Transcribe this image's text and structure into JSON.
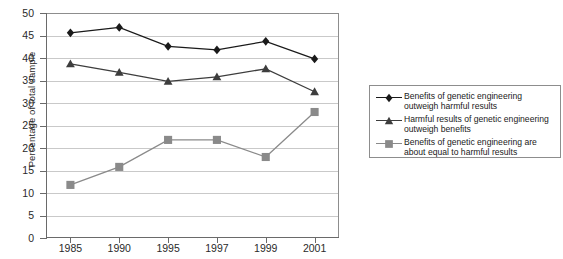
{
  "chart_data": {
    "type": "line",
    "title": "",
    "xlabel": "",
    "ylabel": "Percentage of total sample",
    "categories": [
      "1985",
      "1990",
      "1995",
      "1997",
      "1999",
      "2001"
    ],
    "ylim": [
      0,
      50
    ],
    "ytick_labels": [
      "0",
      "5",
      "10",
      "15",
      "20",
      "25",
      "30",
      "35",
      "40",
      "45",
      "50"
    ],
    "ytick_values": [
      0,
      5,
      10,
      15,
      20,
      25,
      30,
      35,
      40,
      45,
      50
    ],
    "grid": "horizontal",
    "legend_position": "right",
    "series": [
      {
        "name": "Benefits of genetic engineering\noutweigh harmful results",
        "marker": "diamond",
        "color": "#1a1a1a",
        "values": [
          45.6,
          46.8,
          42.6,
          41.8,
          43.7,
          39.8
        ]
      },
      {
        "name": "Harmful results of genetic engineering\noutweigh benefits",
        "marker": "triangle",
        "color": "#3d3d3d",
        "values": [
          38.7,
          36.8,
          34.8,
          35.8,
          37.6,
          32.5
        ]
      },
      {
        "name": "Benefits of genetic engineering are\nabout equal to harmful results",
        "marker": "square",
        "color": "#8a8a8a",
        "values": [
          11.8,
          15.8,
          21.8,
          21.8,
          18.0,
          28.0
        ]
      }
    ]
  },
  "colors": {
    "series_diamond": "#1a1a1a",
    "series_triangle": "#3d3d3d",
    "series_square": "#8a8a8a",
    "gridline": "#c9c9c9",
    "axis": "#6a6a6a",
    "frame": "#8d8d8d",
    "background": "#ffffff",
    "text": "#1a1a1a"
  }
}
